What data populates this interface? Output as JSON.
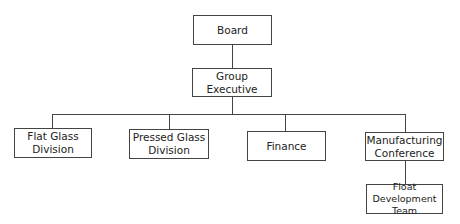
{
  "chart": {
    "type": "org-chart",
    "nodes": {
      "board": {
        "label": "Board"
      },
      "group_executive": {
        "label": "Group Executive"
      },
      "flat_glass": {
        "label": "Flat Glass Division"
      },
      "pressed_glass": {
        "label": "Pressed Glass Division"
      },
      "finance": {
        "label": "Finance"
      },
      "manufacturing": {
        "label": "Manufacturing Conference"
      },
      "float_dev": {
        "label": "Float Development Team"
      }
    },
    "edges": [
      [
        "board",
        "group_executive"
      ],
      [
        "group_executive",
        "flat_glass"
      ],
      [
        "group_executive",
        "pressed_glass"
      ],
      [
        "group_executive",
        "finance"
      ],
      [
        "group_executive",
        "manufacturing"
      ],
      [
        "manufacturing",
        "float_dev"
      ]
    ]
  }
}
